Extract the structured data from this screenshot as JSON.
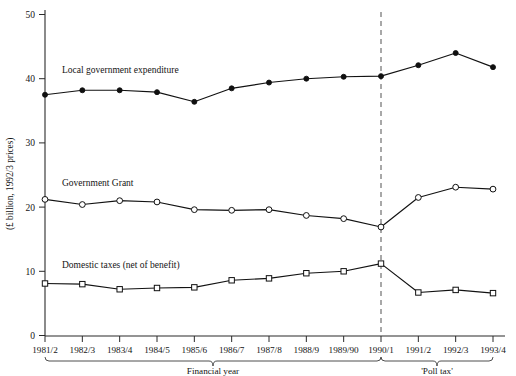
{
  "chart_data": {
    "type": "line",
    "title": "",
    "xlabel": "Financial year",
    "ylabel": "(£ billion, 1992/3 prices)",
    "categories": [
      "1981/2",
      "1982/3",
      "1983/4",
      "1984/5",
      "1985/6",
      "1986/7",
      "1987/8",
      "1988/9",
      "1989/90",
      "1990/1",
      "1991/2",
      "1992/3",
      "1993/4"
    ],
    "ylim": [
      0,
      52
    ],
    "yticks": [
      0,
      10,
      20,
      30,
      40,
      50
    ],
    "ytick_labels": [
      "0",
      "10",
      "20",
      "30",
      "40",
      "50"
    ],
    "grid": false,
    "legend_position": "inline-annotations",
    "series": [
      {
        "name": "Local government expenditure",
        "marker": "filled-circle",
        "label_x": "1982/3",
        "values": [
          37.5,
          38.2,
          38.2,
          37.9,
          36.4,
          38.5,
          39.4,
          40.0,
          40.3,
          40.4,
          42.1,
          44.0,
          41.8
        ]
      },
      {
        "name": "Government Grant",
        "marker": "open-circle",
        "label_x": "1982/3",
        "values": [
          21.2,
          20.4,
          21.0,
          20.8,
          19.6,
          19.5,
          19.6,
          18.7,
          18.2,
          16.9,
          21.5,
          23.1,
          22.8
        ]
      },
      {
        "name": "Domestic taxes (net of benefit)",
        "marker": "open-square",
        "label_x": "1982/3",
        "values": [
          8.1,
          8.0,
          7.2,
          7.4,
          7.5,
          8.6,
          8.9,
          9.7,
          10.0,
          11.2,
          6.7,
          7.1,
          6.6
        ]
      }
    ],
    "annotations": [
      {
        "name": "poll-tax-bracket",
        "label": "'Poll tax'",
        "from": "1990/1",
        "to": "1993/4"
      },
      {
        "name": "financial-year-bracket",
        "label": "Financial year",
        "from": "1981/2",
        "to": "1990/1"
      },
      {
        "name": "poll-tax-divider",
        "label": "",
        "at": "1990/1",
        "style": "dashed-vertical"
      }
    ]
  },
  "axis": {
    "y_title": "(£ billion, 1992/3 prices)",
    "x_title": "Financial year",
    "poll_tax_label": "'Poll tax'"
  },
  "series_labels": {
    "expenditure": "Local government expenditure",
    "grant": "Government Grant",
    "taxes": "Domestic taxes (net of benefit)"
  },
  "colors": {
    "line": "#121212",
    "axis": "#2b2b2b",
    "divider": "#6f6f6f",
    "background": "#ffffff"
  }
}
